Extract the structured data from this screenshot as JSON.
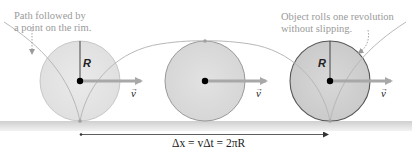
{
  "annotations": {
    "path_note_line1": "Path followed by",
    "path_note_line2": "a point on the rim.",
    "object_note_line1": "Object rolls one revolution",
    "object_note_line2": "without slipping."
  },
  "symbols": {
    "radius_label_1": "R",
    "radius_label_3": "R",
    "velocity_label_1": "v",
    "velocity_label_2": "v",
    "velocity_label_3": "v",
    "displacement_equation": "Δx = vΔt = 2πR"
  },
  "colors": {
    "disk_fill": "#dcdcdc",
    "disk_fill_dark": "#cfcfcf",
    "disk_stroke": "#8a8a8a",
    "cycloid": "#b8b8b8",
    "arrow": "#a8a8a8",
    "ground": "#d6d6d6",
    "annotation_text": "#9a9a9a"
  }
}
